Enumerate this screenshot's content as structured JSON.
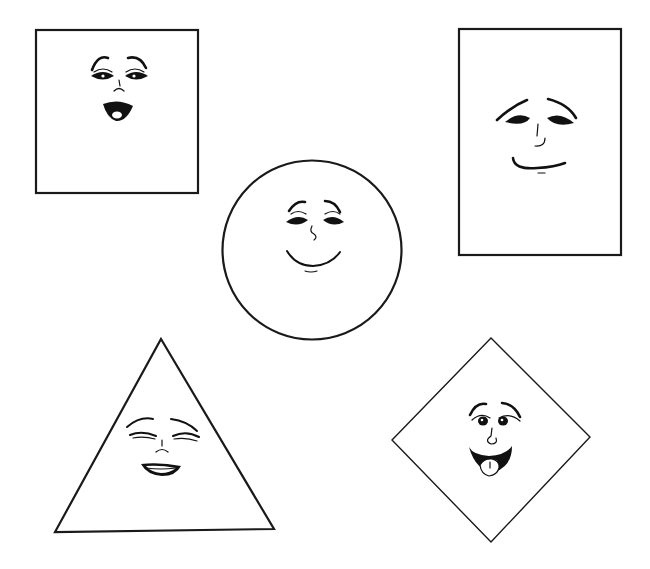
{
  "page": {
    "title": "Shapes with faces",
    "background": "#ffffff",
    "ink_color": "#111111"
  },
  "shapes": [
    {
      "id": "square",
      "label": "Square",
      "expression": "surprised",
      "bbox": [
        36,
        30,
        198,
        193
      ]
    },
    {
      "id": "rectangle",
      "label": "Rectangle",
      "expression": "content smile",
      "bbox": [
        459,
        29,
        621,
        255
      ]
    },
    {
      "id": "circle",
      "label": "Circle",
      "expression": "happy smile",
      "center": [
        312,
        250
      ],
      "radius": 90
    },
    {
      "id": "triangle",
      "label": "Triangle",
      "expression": "laughing eyes closed",
      "points": [
        [
          161,
          339
        ],
        [
          274,
          529
        ],
        [
          55,
          532
        ]
      ]
    },
    {
      "id": "diamond",
      "label": "Diamond",
      "expression": "laughing tongue out",
      "points": [
        [
          491,
          338
        ],
        [
          590,
          437
        ],
        [
          491,
          542
        ],
        [
          392,
          440
        ]
      ]
    }
  ]
}
